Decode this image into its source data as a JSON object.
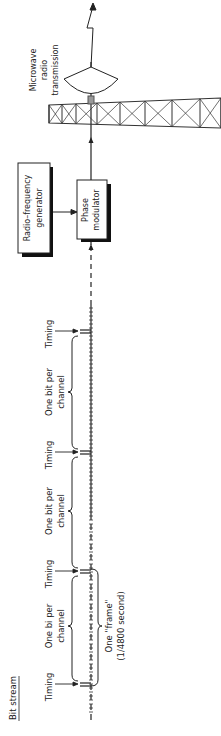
{
  "diagram": {
    "title": "Bit stream",
    "orientation": "rotated 90° counter-clockwise (reads bottom-to-top)",
    "blocks": [
      {
        "id": "rf-generator",
        "label_lines": [
          "Radio–frequency",
          "generator"
        ]
      },
      {
        "id": "phase-modulator",
        "label_lines": [
          "Phase",
          "modulator"
        ]
      }
    ],
    "antenna": {
      "label_lines": [
        "Microwave",
        "radio",
        "transmission"
      ]
    },
    "bitstream": {
      "timing_label": "Timing",
      "channel_label_lines": [
        "One bit per",
        "channel"
      ],
      "channel_label_first_lines": [
        "One bi  per",
        "channel"
      ],
      "frame_label_lines": [
        "One \"frame\"",
        "(1/4800 second)"
      ],
      "segments": [
        "Timing",
        "One bit per channel",
        "Timing",
        "One bit per channel",
        "Timing",
        "One bit per channel",
        "Timing"
      ]
    },
    "flow": [
      "Bit stream",
      "Phase modulator",
      "Microwave radio transmission"
    ],
    "flow_inputs": [
      {
        "from": "Radio–frequency generator",
        "to": "Phase modulator"
      }
    ]
  }
}
